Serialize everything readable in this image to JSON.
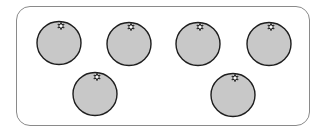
{
  "figure": {
    "object_name": "orange",
    "count": 6,
    "colors": {
      "fruit_fill": "#c8c8c8",
      "fruit_outline": "#1e1e1e",
      "frame_border": "#8a8a8a",
      "background": "#ffffff"
    },
    "oranges": [
      {
        "cx": 59,
        "cy": 42,
        "r": 22
      },
      {
        "cx": 129,
        "cy": 43,
        "r": 22
      },
      {
        "cx": 198,
        "cy": 43,
        "r": 22
      },
      {
        "cx": 269,
        "cy": 43,
        "r": 22
      },
      {
        "cx": 95,
        "cy": 93,
        "r": 22
      },
      {
        "cx": 233,
        "cy": 94,
        "r": 22
      }
    ]
  }
}
